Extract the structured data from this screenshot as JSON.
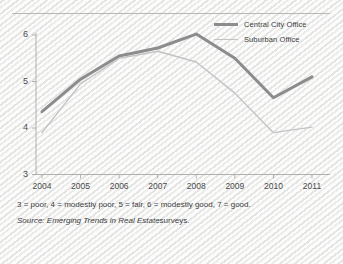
{
  "chart_data": {
    "type": "line",
    "title": "",
    "xlabel": "",
    "ylabel": "",
    "x": [
      2004,
      2005,
      2006,
      2007,
      2008,
      2009,
      2010,
      2011
    ],
    "categories": [
      "2004",
      "2005",
      "2006",
      "2007",
      "2008",
      "2009",
      "2010",
      "2011"
    ],
    "xlim": [
      2004,
      2011
    ],
    "ylim": [
      3,
      6
    ],
    "yticks": [
      3,
      4,
      5,
      6
    ],
    "ytick_labels": [
      "3",
      "4",
      "5",
      "6"
    ],
    "xtick_labels": [
      "2004",
      "2005",
      "2006",
      "2007",
      "2008",
      "2009",
      "2010",
      "2011"
    ],
    "grid": false,
    "legend_position": "top-right",
    "series": [
      {
        "name": "Central City Office",
        "color": "#8c8c8c",
        "width": 3,
        "values": [
          4.35,
          5.05,
          5.55,
          5.72,
          6.02,
          5.5,
          4.65,
          5.1
        ]
      },
      {
        "name": "Suburban Office",
        "color": "#c3c3c3",
        "width": 1.4,
        "values": [
          3.9,
          4.95,
          5.5,
          5.65,
          5.42,
          4.75,
          3.9,
          4.02
        ]
      }
    ]
  },
  "legend": {
    "items": [
      {
        "label": "Central City Office",
        "style": "thick"
      },
      {
        "label": "Suburban Office",
        "style": "thin"
      }
    ]
  },
  "notes": {
    "scale": "3 = poor, 4 = modestly poor, 5 = fair, 6 = modestly good, 7 = good.",
    "source_prefix": "Source:",
    "source_title": "Emerging Trends in Real Estate",
    "source_suffix": "surveys."
  },
  "colors": {
    "central_city": "#8c8c8c",
    "suburban": "#c3c3c3",
    "axis": "#b0b0ae",
    "text": "#3c3c3c",
    "background": "#f2f2f1"
  }
}
